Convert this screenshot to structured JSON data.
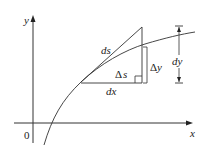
{
  "diagram": {
    "axes": {
      "x_label": "x",
      "y_label": "y",
      "origin_label": "0"
    },
    "labels": {
      "ds": "ds",
      "delta_s_sym": "Δ",
      "delta_s_var": "s",
      "delta_y_sym": "Δ",
      "delta_y_var": "y",
      "dx": "dx",
      "dy": "dy"
    },
    "colors": {
      "line": "#333333",
      "background": "#ffffff"
    }
  }
}
